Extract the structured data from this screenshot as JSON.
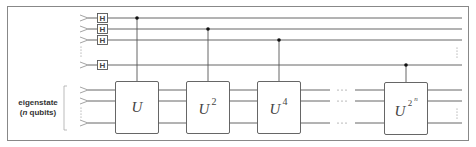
{
  "diagram": {
    "register_label_line1": "eigenstate",
    "register_label_line2": "(n qubits)",
    "register_label_n": "n",
    "register_label_rest": " qubits)",
    "hadamard_label": "H",
    "gates": [
      {
        "base": "U",
        "exponent": ""
      },
      {
        "base": "U",
        "exponent": "2"
      },
      {
        "base": "U",
        "exponent": "4"
      },
      {
        "base": "U",
        "exponent": "2",
        "sub_exponent": "n"
      }
    ],
    "ellipsis_horizontal": "···",
    "ellipsis_vertical": "⋮",
    "colors": {
      "wire": "#555555",
      "frame": "#888888",
      "input_marker": "#9a9a9a",
      "control_dot": "#111111",
      "text": "#333333"
    }
  }
}
